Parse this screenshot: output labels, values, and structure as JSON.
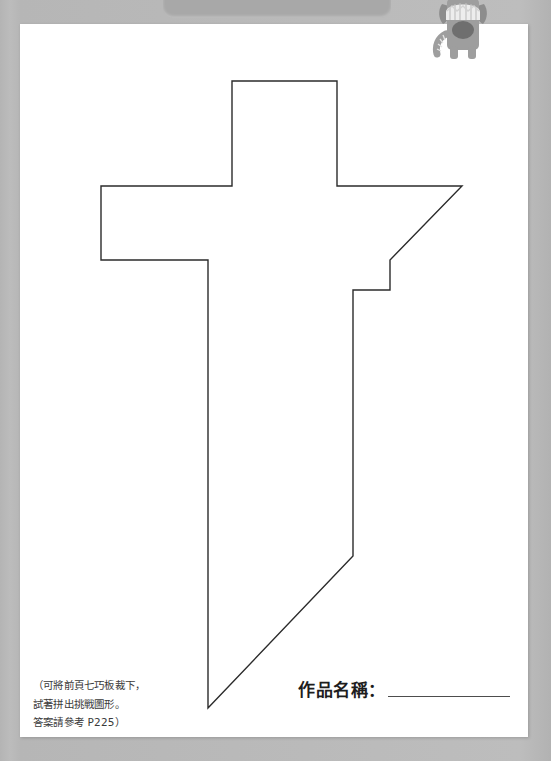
{
  "page": {
    "background_color": "#b9b9b9",
    "sheet_color": "#ffffff"
  },
  "top_tab": {
    "label": "",
    "color": "#a8a8a8"
  },
  "mascot": {
    "name": "grey-cat-monster-mascot",
    "body_color": "#9a9a9a",
    "hat_color": "#e8e8e8",
    "mouth_color": "#6d6d6d"
  },
  "figure": {
    "name": "sword-tangram-outline",
    "stroke_color": "#2b2b2b",
    "stroke_width": 1.4,
    "fill": "none",
    "points": "232,81 337,81 337,186 462,186 390,260 390,290 353,290 353,556 208,708 208,260 101,260 101,186 232,186"
  },
  "instructions": {
    "line1": "（可將前頁七巧板裁下，",
    "line2": "試著拼出挑戰圖形。",
    "line3": "答案請參考 P225）"
  },
  "title_field": {
    "label": "作品名稱：",
    "value": ""
  }
}
